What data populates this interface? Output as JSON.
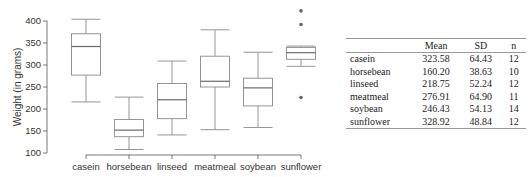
{
  "chart_data": {
    "type": "box",
    "title": "",
    "xlabel": "",
    "ylabel": "Weight (in grams)",
    "ylim": [
      100,
      400
    ],
    "yticks": [
      100,
      150,
      200,
      250,
      300,
      350,
      400
    ],
    "categories": [
      "casein",
      "horsebean",
      "linseed",
      "meatmeal",
      "soybean",
      "sunflower"
    ],
    "boxes": [
      {
        "name": "casein",
        "whisker_low": 216,
        "q1": 277,
        "median": 342,
        "q3": 371,
        "whisker_high": 404,
        "outliers": []
      },
      {
        "name": "horsebean",
        "whisker_low": 108,
        "q1": 137,
        "median": 152,
        "q3": 176,
        "whisker_high": 227,
        "outliers": []
      },
      {
        "name": "linseed",
        "whisker_low": 141,
        "q1": 178,
        "median": 221,
        "q3": 258,
        "whisker_high": 309,
        "outliers": []
      },
      {
        "name": "meatmeal",
        "whisker_low": 153,
        "q1": 250,
        "median": 263,
        "q3": 320,
        "whisker_high": 380,
        "outliers": []
      },
      {
        "name": "soybean",
        "whisker_low": 158,
        "q1": 207,
        "median": 248,
        "q3": 270,
        "whisker_high": 329,
        "outliers": []
      },
      {
        "name": "sunflower",
        "whisker_low": 297,
        "q1": 313,
        "median": 328,
        "q3": 340,
        "whisker_high": 343,
        "outliers": [
          423,
          392,
          226
        ]
      }
    ],
    "grid": false,
    "legend": null
  },
  "table": {
    "headers": [
      "",
      "Mean",
      "SD",
      "n"
    ],
    "rows": [
      {
        "feed": "casein",
        "mean": "323.58",
        "sd": "64.43",
        "n": "12"
      },
      {
        "feed": "horsebean",
        "mean": "160.20",
        "sd": "38.63",
        "n": "10"
      },
      {
        "feed": "linseed",
        "mean": "218.75",
        "sd": "52.24",
        "n": "12"
      },
      {
        "feed": "meatmeal",
        "mean": "276.91",
        "sd": "64.90",
        "n": "11"
      },
      {
        "feed": "soybean",
        "mean": "246.43",
        "sd": "54.13",
        "n": "14"
      },
      {
        "feed": "sunflower",
        "mean": "328.92",
        "sd": "48.84",
        "n": "12"
      }
    ]
  },
  "colors": {
    "box_stroke": "#8a8a8a",
    "axis": "#555555",
    "outlier": "#666666",
    "text": "#333333",
    "rule": "#999999"
  }
}
